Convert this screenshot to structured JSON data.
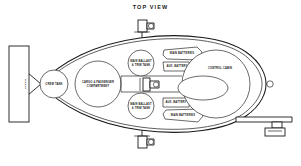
{
  "diagram": {
    "title": "TOP VIEW",
    "colors": {
      "line": "#1a1a1a",
      "background": "#ffffff"
    },
    "labels": {
      "stern_panel": "STERN",
      "crew_tank": "CREW TANK",
      "cargo_compartment_line1": "CARGO & PASSENGER",
      "cargo_compartment_line2": "COMPARTMENT",
      "ballast_upper_line1": "MAIN BALLAST",
      "ballast_upper_line2": "& TRIM TANK",
      "ballast_lower_line1": "MAIN BALLAST",
      "ballast_lower_line2": "& TRIM TANK",
      "main_batteries_upper": "MAIN BATTERIES",
      "aux_battery_upper": "AUX. BATTERY",
      "aux_battery_lower": "AUX. BATTERY",
      "main_batteries_lower": "MAIN BATTERIES",
      "control_cabin": "CONTROL CABIN"
    },
    "components": [
      {
        "name": "stern-panel",
        "shape": "rectangle"
      },
      {
        "name": "crew-tank",
        "shape": "circle"
      },
      {
        "name": "cargo-compartment",
        "shape": "circle"
      },
      {
        "name": "ballast-tank-upper",
        "shape": "circle"
      },
      {
        "name": "ballast-tank-lower",
        "shape": "circle"
      },
      {
        "name": "main-batteries-upper",
        "shape": "hexagon-box"
      },
      {
        "name": "main-batteries-lower",
        "shape": "hexagon-box"
      },
      {
        "name": "aux-battery-upper",
        "shape": "rectangle"
      },
      {
        "name": "aux-battery-lower",
        "shape": "rectangle"
      },
      {
        "name": "control-cabin",
        "shape": "circle"
      },
      {
        "name": "viewport-dome",
        "shape": "ellipse"
      },
      {
        "name": "thruster-top",
        "shape": "pod-on-strut"
      },
      {
        "name": "thruster-bottom",
        "shape": "pod-on-strut"
      },
      {
        "name": "thruster-center",
        "shape": "pod-on-strut"
      },
      {
        "name": "bow-port",
        "shape": "small-circle"
      },
      {
        "name": "manipulator-boom",
        "shape": "arm"
      }
    ]
  }
}
